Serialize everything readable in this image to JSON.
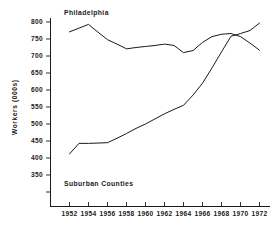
{
  "chart_data": {
    "type": "line",
    "title": "",
    "xlabel": "",
    "ylabel": "Workers (000s)",
    "xlim": [
      1951,
      1973
    ],
    "ylim": [
      330,
      815
    ],
    "grid": false,
    "legend_position": "inline-annotation",
    "x_ticks": [
      1952,
      1954,
      1956,
      1958,
      1960,
      1962,
      1964,
      1966,
      1968,
      1970,
      1972
    ],
    "x_tick_labels": [
      "1952",
      "1954",
      "1956",
      "1958",
      "1960",
      "1962",
      "1964",
      "1966",
      "1968",
      "1970",
      "1972"
    ],
    "y_ticks": [
      350,
      400,
      450,
      500,
      550,
      600,
      650,
      700,
      750,
      800
    ],
    "y_tick_labels": [
      "350",
      "400",
      "450",
      "500",
      "550",
      "600",
      "650",
      "700",
      "750",
      "800"
    ],
    "series": [
      {
        "name": "Philadelphia",
        "annotation": "Philadelphia",
        "x": [
          1952,
          1953,
          1954,
          1955,
          1956,
          1957,
          1958,
          1959,
          1960,
          1961,
          1962,
          1963,
          1964,
          1965,
          1966,
          1967,
          1968,
          1969,
          1970,
          1971,
          1972
        ],
        "values": [
          771,
          782,
          793,
          770,
          748,
          735,
          721,
          725,
          728,
          731,
          735,
          731,
          710,
          716,
          740,
          757,
          764,
          766,
          757,
          738,
          717
        ]
      },
      {
        "name": "Suburban Counties",
        "annotation": "Suburban  Counties",
        "x": [
          1952,
          1953,
          1954,
          1955,
          1956,
          1957,
          1958,
          1959,
          1960,
          1961,
          1962,
          1963,
          1964,
          1965,
          1966,
          1967,
          1968,
          1969,
          1970,
          1971,
          1972
        ],
        "values": [
          412,
          443,
          443,
          444,
          445,
          458,
          472,
          487,
          500,
          515,
          530,
          543,
          555,
          585,
          620,
          665,
          712,
          758,
          766,
          775,
          797
        ]
      }
    ]
  },
  "axis": {
    "y_title": "Workers (000s)"
  },
  "annotations": {
    "philadelphia": "Philadelphia",
    "suburban": "Suburban  Counties"
  }
}
